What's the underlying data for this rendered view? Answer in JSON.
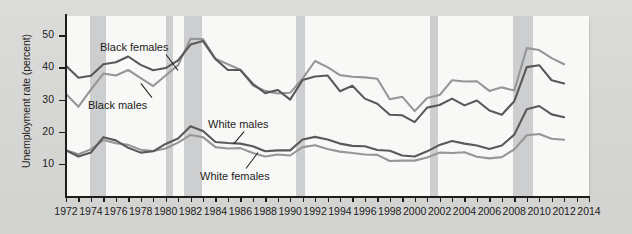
{
  "chart_data": {
    "type": "line",
    "title": "",
    "xlabel": "",
    "ylabel": "Unemployment rate (percent)",
    "xlim": [
      1972,
      2014
    ],
    "ylim": [
      0,
      56
    ],
    "yticks": [
      10,
      20,
      30,
      40,
      50
    ],
    "xticks": [
      1972,
      1973,
      1974,
      1975,
      1976,
      1977,
      1978,
      1979,
      1980,
      1981,
      1982,
      1983,
      1984,
      1985,
      1986,
      1987,
      1988,
      1989,
      1990,
      1991,
      1992,
      1993,
      1994,
      1995,
      1996,
      1997,
      1998,
      1999,
      2000,
      2001,
      2002,
      2003,
      2004,
      2005,
      2006,
      2007,
      2008,
      2009,
      2010,
      2011,
      2012,
      2013,
      2014
    ],
    "xtick_labels": [
      "1972",
      "1974",
      "1976",
      "1978",
      "1980",
      "1982",
      "1984",
      "1986",
      "1988",
      "1990",
      "1992",
      "1994",
      "1996",
      "1998",
      "2000",
      "2002",
      "2004",
      "2006",
      "2008",
      "2010",
      "2012",
      "2014"
    ],
    "grid": false,
    "legend_position": "inline-annotations",
    "x": [
      1972,
      1973,
      1974,
      1975,
      1976,
      1977,
      1978,
      1979,
      1980,
      1981,
      1982,
      1983,
      1984,
      1985,
      1986,
      1987,
      1988,
      1989,
      1990,
      1991,
      1992,
      1993,
      1994,
      1995,
      1996,
      1997,
      1998,
      1999,
      2000,
      2001,
      2002,
      2003,
      2004,
      2005,
      2006,
      2007,
      2008,
      2009,
      2010,
      2011,
      2012
    ],
    "series": [
      {
        "name": "Black females",
        "color": "#59595b",
        "values": [
          40.5,
          36.8,
          37.4,
          41.0,
          41.6,
          43.4,
          40.8,
          39.1,
          39.8,
          42.2,
          47.1,
          48.2,
          42.6,
          39.2,
          39.2,
          34.9,
          32.0,
          33.0,
          30.0,
          36.1,
          37.2,
          37.5,
          32.6,
          34.3,
          30.3,
          28.7,
          25.3,
          25.1,
          23.0,
          27.5,
          28.3,
          30.3,
          28.2,
          29.7,
          26.6,
          25.3,
          29.5,
          40.1,
          40.7,
          36.0,
          35.0
        ]
      },
      {
        "name": "Black males",
        "color": "#959698",
        "values": [
          31.7,
          27.8,
          33.1,
          38.1,
          37.5,
          39.2,
          36.7,
          34.2,
          37.5,
          40.7,
          48.9,
          48.8,
          42.7,
          41.0,
          39.3,
          34.4,
          32.7,
          31.9,
          32.1,
          36.5,
          42.0,
          40.1,
          37.6,
          37.1,
          36.9,
          36.5,
          30.1,
          30.9,
          26.4,
          30.5,
          31.4,
          36.0,
          35.6,
          35.7,
          32.7,
          33.8,
          32.8,
          46.0,
          45.4,
          42.9,
          41.0
        ]
      },
      {
        "name": "White males",
        "color": "#59595b",
        "values": [
          14.2,
          12.3,
          13.5,
          18.3,
          17.3,
          15.0,
          13.5,
          13.9,
          16.2,
          17.9,
          21.7,
          20.2,
          16.8,
          16.5,
          16.3,
          15.5,
          13.9,
          14.2,
          14.2,
          17.6,
          18.4,
          17.6,
          16.3,
          15.6,
          15.5,
          14.3,
          14.1,
          12.6,
          12.3,
          13.9,
          15.9,
          17.1,
          16.3,
          15.7,
          14.6,
          15.7,
          19.1,
          27.0,
          28.0,
          25.4,
          24.5
        ]
      },
      {
        "name": "White females",
        "color": "#959698",
        "values": [
          14.2,
          13.0,
          14.5,
          17.4,
          16.4,
          15.9,
          14.4,
          14.0,
          14.8,
          16.6,
          19.0,
          18.3,
          15.2,
          14.8,
          14.9,
          13.4,
          12.3,
          12.9,
          12.6,
          15.2,
          15.8,
          14.6,
          13.8,
          13.4,
          12.9,
          12.8,
          10.9,
          11.0,
          11.0,
          12.0,
          13.5,
          13.4,
          13.6,
          12.2,
          11.7,
          12.1,
          14.5,
          18.9,
          19.3,
          17.8,
          17.5
        ]
      }
    ],
    "recession_bands": [
      {
        "label": "1973-1975 recession",
        "start": 1973.9,
        "end": 1975.2
      },
      {
        "label": "1980 recession",
        "start": 1980.0,
        "end": 1980.6
      },
      {
        "label": "1981-1982 recession",
        "start": 1981.5,
        "end": 1982.9
      },
      {
        "label": "1990-1991 recession",
        "start": 1990.5,
        "end": 1991.2
      },
      {
        "label": "2001 recession",
        "start": 2001.2,
        "end": 2001.9
      },
      {
        "label": "2007-2009 recession",
        "start": 2007.9,
        "end": 2009.5
      }
    ],
    "annotations": [
      {
        "id": "black-females",
        "text": "Black females"
      },
      {
        "id": "black-males",
        "text": "Black males"
      },
      {
        "id": "white-males",
        "text": "White males"
      },
      {
        "id": "white-females",
        "text": "White females"
      }
    ]
  }
}
